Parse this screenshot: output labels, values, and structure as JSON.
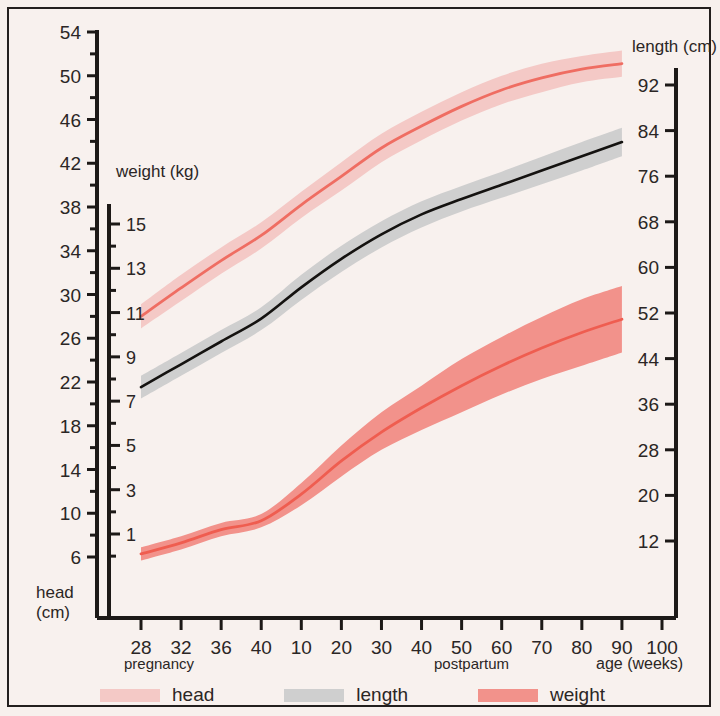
{
  "chart_data": {
    "type": "line",
    "title": "",
    "subtitle": "",
    "xlabel": "age (weeks)",
    "x_group_labels": [
      "pregnancy",
      "postpartum"
    ],
    "x_ticks": [
      {
        "label": "28",
        "pos": 0
      },
      {
        "label": "32",
        "pos": 1
      },
      {
        "label": "36",
        "pos": 2
      },
      {
        "label": "40",
        "pos": 3
      },
      {
        "label": "10",
        "pos": 4
      },
      {
        "label": "20",
        "pos": 5
      },
      {
        "label": "30",
        "pos": 6
      },
      {
        "label": "40",
        "pos": 7
      },
      {
        "label": "50",
        "pos": 8
      },
      {
        "label": "60",
        "pos": 9
      },
      {
        "label": "70",
        "pos": 10
      },
      {
        "label": "80",
        "pos": 11
      },
      {
        "label": "90",
        "pos": 12
      },
      {
        "label": "100",
        "pos": 13
      }
    ],
    "axes": [
      {
        "id": "head",
        "name": "head",
        "title_line1": "head",
        "title_line2": "(cm)",
        "unit": "cm",
        "side": "left-outer",
        "ticks": [
          54,
          50,
          46,
          42,
          38,
          34,
          30,
          26,
          22,
          18,
          14,
          10,
          6
        ],
        "minor_step": 2,
        "range": [
          4,
          56
        ]
      },
      {
        "id": "weight",
        "name": "weight",
        "title": "weight (kg)",
        "unit": "kg",
        "side": "left-inner",
        "ticks": [
          15,
          13,
          11,
          9,
          7,
          5,
          3,
          1
        ],
        "minor_step": 1,
        "range": [
          0,
          16
        ]
      },
      {
        "id": "length",
        "name": "length",
        "title": "length (cm)",
        "unit": "cm",
        "side": "right",
        "ticks": [
          92,
          84,
          76,
          68,
          60,
          52,
          44,
          36,
          28,
          20,
          12
        ],
        "minor_step": 4,
        "range": [
          8,
          96
        ]
      }
    ],
    "grid": false,
    "legend_position": "bottom",
    "legend": [
      {
        "label": "head",
        "band_color": "#f4c9c6",
        "line_color": "#ef6d62"
      },
      {
        "label": "length",
        "band_color": "#cfcfcf",
        "line_color": "#141210"
      },
      {
        "label": "weight",
        "band_color": "#f2928b",
        "line_color": "#ef5d50"
      }
    ],
    "series": [
      {
        "name": "head",
        "axis": "head",
        "unit": "cm",
        "line_color": "#ef6d62",
        "band_color": "#f4c9c6",
        "x": [
          28,
          32,
          36,
          40,
          10,
          20,
          30,
          40,
          50,
          60,
          70,
          80,
          90
        ],
        "x_pos": [
          0,
          1,
          2,
          3,
          4,
          5,
          6,
          7,
          8,
          9,
          10,
          11,
          12
        ],
        "mean": [
          28.0,
          30.6,
          33.1,
          35.4,
          38.2,
          40.8,
          43.4,
          45.4,
          47.2,
          48.7,
          49.8,
          50.6,
          51.1
        ],
        "lower": [
          26.9,
          29.4,
          31.9,
          34.2,
          37.0,
          39.5,
          42.1,
          44.1,
          45.9,
          47.4,
          48.5,
          49.4,
          49.9
        ],
        "upper": [
          29.1,
          31.8,
          34.3,
          36.6,
          39.4,
          42.1,
          44.7,
          46.7,
          48.5,
          50.0,
          51.1,
          51.8,
          52.3
        ]
      },
      {
        "name": "length",
        "axis": "length",
        "unit": "cm",
        "line_color": "#141210",
        "band_color": "#cfcfcf",
        "x": [
          28,
          32,
          36,
          40,
          10,
          20,
          30,
          40,
          50,
          60,
          70,
          80,
          90
        ],
        "x_pos": [
          0,
          1,
          2,
          3,
          4,
          5,
          6,
          7,
          8,
          9,
          10,
          11,
          12
        ],
        "mean": [
          39.0,
          43.0,
          47.0,
          51.0,
          56.5,
          61.5,
          65.8,
          69.3,
          72.0,
          74.5,
          77.0,
          79.5,
          82.0
        ],
        "lower": [
          37.0,
          41.0,
          45.0,
          49.0,
          54.3,
          59.2,
          63.5,
          67.0,
          69.8,
          72.2,
          74.6,
          77.0,
          79.5
        ],
        "upper": [
          41.0,
          45.0,
          49.0,
          53.0,
          58.7,
          63.8,
          68.1,
          71.6,
          74.3,
          76.8,
          79.4,
          82.0,
          84.5
        ]
      },
      {
        "name": "weight",
        "axis": "weight",
        "unit": "kg",
        "line_color": "#ef5d50",
        "band_color": "#f2928b",
        "x": [
          28,
          32,
          36,
          40,
          10,
          20,
          30,
          40,
          50,
          60,
          70,
          80,
          90
        ],
        "x_pos": [
          0,
          1,
          2,
          3,
          4,
          5,
          6,
          7,
          8,
          9,
          10,
          11,
          12
        ],
        "mean": [
          0.1,
          0.6,
          1.2,
          1.6,
          2.8,
          4.3,
          5.6,
          6.7,
          7.7,
          8.6,
          9.4,
          10.1,
          10.7
        ],
        "lower": [
          -0.2,
          0.3,
          0.9,
          1.3,
          2.3,
          3.6,
          4.8,
          5.7,
          6.5,
          7.3,
          8.0,
          8.6,
          9.2
        ],
        "upper": [
          0.4,
          0.9,
          1.5,
          1.9,
          3.3,
          5.0,
          6.5,
          7.7,
          8.9,
          9.9,
          10.8,
          11.6,
          12.2
        ]
      }
    ]
  },
  "labels": {
    "weight_axis_title": "weight (kg)",
    "length_axis_title": "length (cm)",
    "head_axis_title_l1": "head",
    "head_axis_title_l2": "(cm)",
    "x_axis_title": "age (weeks)",
    "pregnancy": "pregnancy",
    "postpartum": "postpartum"
  }
}
